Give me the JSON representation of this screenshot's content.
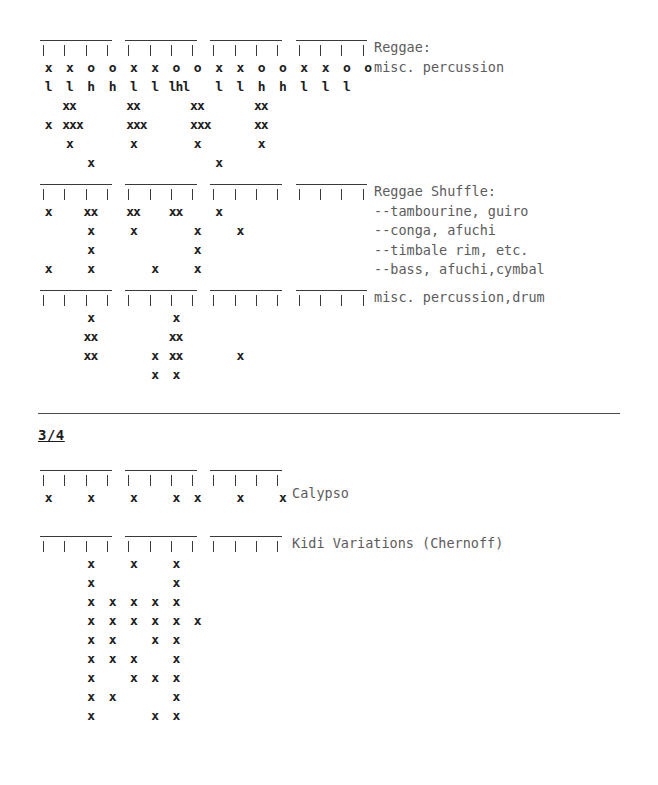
{
  "document": {
    "type": "rhythm-notation-worksheet",
    "glyphs": {
      "stroke": "x",
      "open": "o",
      "low": "l",
      "high": "h"
    }
  },
  "sections": [
    {
      "id": "four-four-implicit",
      "patterns": [
        {
          "id": "reggae",
          "beats": 16,
          "beam_groups": [
            4,
            4,
            4,
            4
          ],
          "labels": [
            "Reggae:",
            "misc. percussion"
          ],
          "rows": [
            {
              "cells": [
                {
                  "col": 0,
                  "t": "x"
                },
                {
                  "col": 1,
                  "t": "x"
                },
                {
                  "col": 2,
                  "t": "o"
                },
                {
                  "col": 3,
                  "t": "o"
                },
                {
                  "col": 4,
                  "t": "x"
                },
                {
                  "col": 5,
                  "t": "x"
                },
                {
                  "col": 6,
                  "t": "o"
                },
                {
                  "col": 7,
                  "t": "o"
                },
                {
                  "col": 8,
                  "t": "x"
                },
                {
                  "col": 9,
                  "t": "x"
                },
                {
                  "col": 10,
                  "t": "o"
                },
                {
                  "col": 11,
                  "t": "o"
                },
                {
                  "col": 12,
                  "t": "x"
                },
                {
                  "col": 13,
                  "t": "x"
                },
                {
                  "col": 14,
                  "t": "o"
                },
                {
                  "col": 15,
                  "t": "o"
                }
              ]
            },
            {
              "cells": [
                {
                  "col": 0,
                  "t": "l"
                },
                {
                  "col": 1,
                  "t": "l"
                },
                {
                  "col": 2,
                  "t": "h"
                },
                {
                  "col": 3,
                  "t": "h"
                },
                {
                  "col": 4,
                  "t": "l"
                },
                {
                  "col": 5,
                  "t": "l"
                },
                {
                  "col": 6,
                  "t": "lhl",
                  "span": 2,
                  "tight": true
                },
                {
                  "col": 8,
                  "t": "l"
                },
                {
                  "col": 9,
                  "t": "l"
                },
                {
                  "col": 10,
                  "t": "h"
                },
                {
                  "col": 11,
                  "t": "h"
                },
                {
                  "col": 12,
                  "t": "l"
                },
                {
                  "col": 13,
                  "t": "l"
                },
                {
                  "col": 14,
                  "t": "l"
                }
              ]
            },
            {
              "cells": [
                {
                  "col": 1,
                  "t": "xx",
                  "span": 2,
                  "tight": true
                },
                {
                  "col": 4,
                  "t": "xx",
                  "span": 2,
                  "tight": true
                },
                {
                  "col": 7,
                  "t": "xx",
                  "span": 2,
                  "tight": true
                },
                {
                  "col": 10,
                  "t": "xx",
                  "span": 2,
                  "tight": true
                }
              ]
            },
            {
              "cells": [
                {
                  "col": 0,
                  "t": "x"
                },
                {
                  "col": 1,
                  "t": "xxx",
                  "span": 3,
                  "tight": true
                },
                {
                  "col": 4,
                  "t": "xxx",
                  "span": 3,
                  "tight": true
                },
                {
                  "col": 7,
                  "t": "xxx",
                  "span": 3,
                  "tight": true
                },
                {
                  "col": 10,
                  "t": "xx",
                  "span": 2,
                  "tight": true
                }
              ]
            },
            {
              "cells": [
                {
                  "col": 1,
                  "t": "x"
                },
                {
                  "col": 4,
                  "t": "x"
                },
                {
                  "col": 7,
                  "t": "x"
                },
                {
                  "col": 10,
                  "t": "x"
                }
              ]
            },
            {
              "cells": [
                {
                  "col": 2,
                  "t": "x"
                },
                {
                  "col": 8,
                  "t": "x"
                }
              ]
            }
          ]
        },
        {
          "id": "reggae-shuffle",
          "beats": 16,
          "beam_groups": [
            4,
            4,
            4,
            4
          ],
          "labels": [
            "Reggae Shuffle:",
            "--tambourine, guiro",
            "--conga, afuchi",
            "--timbale rim, etc.",
            "--bass, afuchi,cymbal"
          ],
          "rows": [
            {
              "cells": [
                {
                  "col": 0,
                  "t": "x"
                },
                {
                  "col": 2,
                  "t": "xx",
                  "span": 2,
                  "tight": true
                },
                {
                  "col": 4,
                  "t": "xx",
                  "span": 2,
                  "tight": true
                },
                {
                  "col": 6,
                  "t": "xx",
                  "span": 2,
                  "tight": true
                },
                {
                  "col": 8,
                  "t": "x"
                }
              ]
            },
            {
              "cells": [
                {
                  "col": 2,
                  "t": "x"
                },
                {
                  "col": 4,
                  "t": "x"
                },
                {
                  "col": 7,
                  "t": "x"
                },
                {
                  "col": 9,
                  "t": "x"
                }
              ]
            },
            {
              "cells": [
                {
                  "col": 2,
                  "t": "x"
                },
                {
                  "col": 7,
                  "t": "x"
                }
              ]
            },
            {
              "cells": [
                {
                  "col": 0,
                  "t": "x"
                },
                {
                  "col": 2,
                  "t": "x"
                },
                {
                  "col": 5,
                  "t": "x"
                },
                {
                  "col": 7,
                  "t": "x"
                }
              ]
            }
          ]
        },
        {
          "id": "misc-percussion-drum",
          "beats": 16,
          "beam_groups": [
            4,
            4,
            4,
            4
          ],
          "labels": [
            "misc. percussion,drum"
          ],
          "rows": [
            {
              "cells": [
                {
                  "col": 2,
                  "t": "x"
                },
                {
                  "col": 6,
                  "t": "x"
                }
              ]
            },
            {
              "cells": [
                {
                  "col": 2,
                  "t": "xx",
                  "span": 2,
                  "tight": true
                },
                {
                  "col": 6,
                  "t": "xx",
                  "span": 2,
                  "tight": true
                }
              ]
            },
            {
              "cells": [
                {
                  "col": 2,
                  "t": "xx",
                  "span": 2,
                  "tight": true
                },
                {
                  "col": 5,
                  "t": "x"
                },
                {
                  "col": 6,
                  "t": "xx",
                  "span": 2,
                  "tight": true
                },
                {
                  "col": 9,
                  "t": "x"
                }
              ]
            },
            {
              "cells": [
                {
                  "col": 5,
                  "t": "x"
                },
                {
                  "col": 6,
                  "t": "x"
                }
              ]
            }
          ]
        }
      ]
    },
    {
      "id": "three-four",
      "heading": "3/4",
      "patterns": [
        {
          "id": "calypso",
          "beats": 12,
          "beam_groups": [
            4,
            4,
            4
          ],
          "labels": [
            "Calypso"
          ],
          "rows": [
            {
              "cells": [
                {
                  "col": 0,
                  "t": "x"
                },
                {
                  "col": 2,
                  "t": "x"
                },
                {
                  "col": 4,
                  "t": "x"
                },
                {
                  "col": 6,
                  "t": "x"
                },
                {
                  "col": 7,
                  "t": "x"
                },
                {
                  "col": 9,
                  "t": "x"
                },
                {
                  "col": 11,
                  "t": "x"
                }
              ]
            }
          ]
        },
        {
          "id": "kidi-variations",
          "beats": 12,
          "beam_groups": [
            4,
            4,
            4
          ],
          "labels": [
            "Kidi Variations (Chernoff)"
          ],
          "rows": [
            {
              "cells": [
                {
                  "col": 2,
                  "t": "x"
                },
                {
                  "col": 4,
                  "t": "x"
                },
                {
                  "col": 6,
                  "t": "x"
                }
              ]
            },
            {
              "cells": [
                {
                  "col": 2,
                  "t": "x"
                },
                {
                  "col": 6,
                  "t": "x"
                }
              ]
            },
            {
              "cells": [
                {
                  "col": 2,
                  "t": "x"
                },
                {
                  "col": 3,
                  "t": "x"
                },
                {
                  "col": 4,
                  "t": "x"
                },
                {
                  "col": 5,
                  "t": "x"
                },
                {
                  "col": 6,
                  "t": "x"
                }
              ]
            },
            {
              "cells": [
                {
                  "col": 2,
                  "t": "x"
                },
                {
                  "col": 3,
                  "t": "x"
                },
                {
                  "col": 4,
                  "t": "x"
                },
                {
                  "col": 5,
                  "t": "x"
                },
                {
                  "col": 6,
                  "t": "x"
                },
                {
                  "col": 7,
                  "t": "x"
                }
              ]
            },
            {
              "cells": [
                {
                  "col": 2,
                  "t": "x"
                },
                {
                  "col": 3,
                  "t": "x"
                },
                {
                  "col": 5,
                  "t": "x"
                },
                {
                  "col": 6,
                  "t": "x"
                }
              ]
            },
            {
              "cells": [
                {
                  "col": 2,
                  "t": "x"
                },
                {
                  "col": 3,
                  "t": "x"
                },
                {
                  "col": 4,
                  "t": "x"
                },
                {
                  "col": 6,
                  "t": "x"
                }
              ]
            },
            {
              "cells": [
                {
                  "col": 2,
                  "t": "x"
                },
                {
                  "col": 4,
                  "t": "x"
                },
                {
                  "col": 5,
                  "t": "x"
                },
                {
                  "col": 6,
                  "t": "x"
                }
              ]
            },
            {
              "cells": [
                {
                  "col": 2,
                  "t": "x"
                },
                {
                  "col": 3,
                  "t": "x"
                },
                {
                  "col": 6,
                  "t": "x"
                }
              ]
            },
            {
              "cells": [
                {
                  "col": 2,
                  "t": "x"
                },
                {
                  "col": 5,
                  "t": "x"
                },
                {
                  "col": 6,
                  "t": "x"
                }
              ]
            }
          ]
        }
      ]
    }
  ],
  "layout": {
    "col_width": 21.3,
    "grid_left": 38,
    "label_left": 374,
    "label_left_alt": 292,
    "blocks": [
      {
        "pattern": "reggae",
        "top": 38,
        "label_top": 38,
        "label_left": 374
      },
      {
        "pattern": "reggae-shuffle",
        "top": 182,
        "label_top": 182,
        "label_left": 374
      },
      {
        "pattern": "misc-percussion-drum",
        "top": 288,
        "label_top": 288,
        "label_left": 374
      },
      {
        "pattern": "calypso",
        "top": 468,
        "label_top": 484,
        "label_left": 292
      },
      {
        "pattern": "kidi-variations",
        "top": 534,
        "label_top": 534,
        "label_left": 292
      }
    ],
    "heading_3_4": {
      "top": 427,
      "left": 38
    },
    "rule": {
      "top": 413,
      "left": 38,
      "width": 582
    }
  }
}
